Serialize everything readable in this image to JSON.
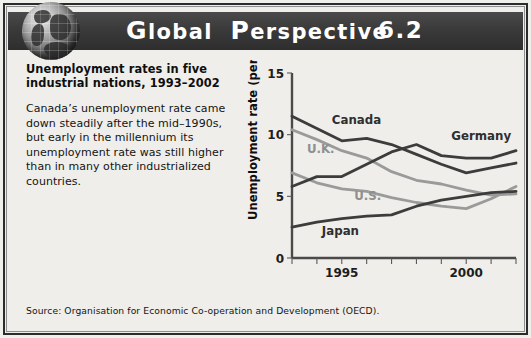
{
  "header": {
    "title_word1": "Global",
    "title_word2": "Perspective",
    "number": "6.2",
    "globe_icon": "globe-icon",
    "band_color": "#333333"
  },
  "blurb": {
    "heading": "Unemployment rates in five industrial nations, 1993–2002",
    "body": "Canada’s unemployment rate came down steadily after the mid–1990s, but early in the millennium its unemployment rate was still higher than in many other industrialized countries."
  },
  "source": {
    "text": "Source: Organisation for Economic Co-operation and Development (OECD)."
  },
  "chart_data": {
    "type": "line",
    "title": "",
    "xlabel": "",
    "ylabel": "Unemployment rate (percent)",
    "ylim": [
      0,
      15
    ],
    "yticks": [
      0,
      5,
      10,
      15
    ],
    "ytick_labels": [
      "0",
      "5",
      "10",
      "15"
    ],
    "xlim": [
      1993,
      2002
    ],
    "x": [
      1993,
      1994,
      1995,
      1996,
      1997,
      1998,
      1999,
      2000,
      2001,
      2002
    ],
    "xticks": [
      1993,
      1994,
      1995,
      1996,
      1997,
      1998,
      1999,
      2000,
      2001,
      2002
    ],
    "xtick_labels": [
      "",
      "",
      "1995",
      "",
      "",
      "",
      "",
      "2000",
      "",
      ""
    ],
    "labeled_xticks": [
      "1995",
      "2000"
    ],
    "grid": false,
    "legend": "inline-labels",
    "series": [
      {
        "name": "Canada",
        "color": "#3c3c3c",
        "values": [
          11.5,
          10.5,
          9.5,
          9.7,
          9.2,
          8.4,
          7.6,
          6.9,
          7.3,
          7.7
        ],
        "label_x": 1994.6,
        "label_y": 10.9
      },
      {
        "name": "U.K.",
        "color": "#9a9a9a",
        "values": [
          10.4,
          9.6,
          8.7,
          8.1,
          7.0,
          6.3,
          6.0,
          5.5,
          5.1,
          5.2
        ],
        "label_x": 1993.6,
        "label_y": 8.5
      },
      {
        "name": "U.S.",
        "color": "#9a9a9a",
        "values": [
          6.9,
          6.1,
          5.6,
          5.4,
          4.9,
          4.5,
          4.2,
          4.0,
          4.8,
          5.8
        ],
        "label_x": 1995.5,
        "label_y": 4.7
      },
      {
        "name": "Germany",
        "color": "#3c3c3c",
        "values": [
          5.8,
          6.6,
          6.6,
          7.6,
          8.6,
          9.2,
          8.3,
          8.1,
          8.1,
          8.7
        ],
        "label_x": 1999.4,
        "label_y": 9.6
      },
      {
        "name": "Japan",
        "color": "#3c3c3c",
        "values": [
          2.5,
          2.9,
          3.2,
          3.4,
          3.5,
          4.2,
          4.7,
          5.0,
          5.3,
          5.4
        ],
        "label_x": 1994.2,
        "label_y": 1.9
      }
    ]
  }
}
